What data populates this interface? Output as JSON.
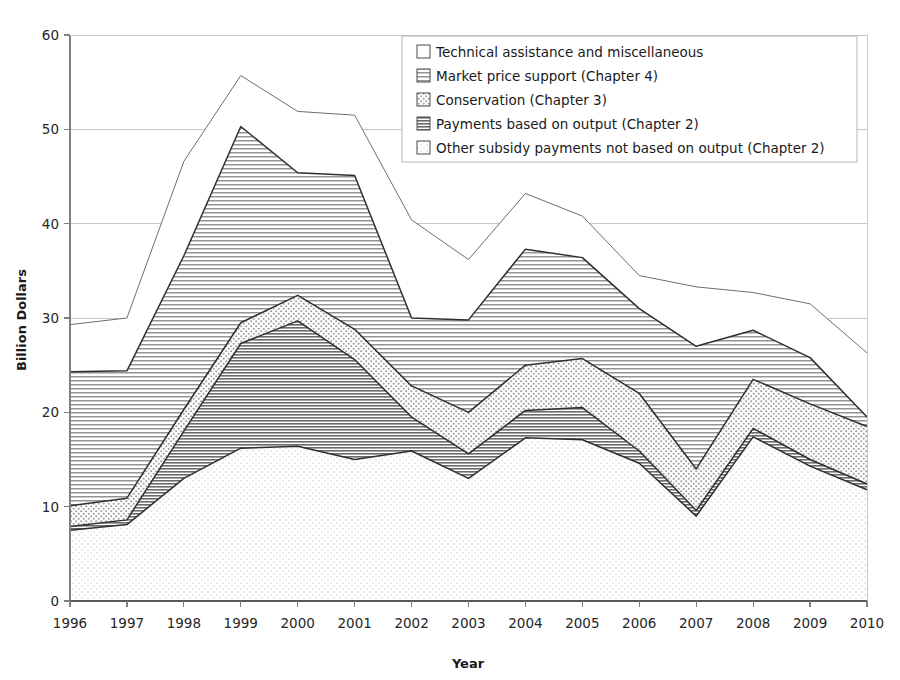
{
  "chart_data": {
    "type": "area",
    "title": "",
    "subtitle": "",
    "xlabel": "Year",
    "ylabel": "Billion Dollars",
    "stacked": true,
    "grid": true,
    "legend_position": "top-right",
    "xlim": [
      1996,
      2010
    ],
    "ylim": [
      0,
      60
    ],
    "yticks": [
      0,
      10,
      20,
      30,
      40,
      50,
      60
    ],
    "categories": [
      "1996",
      "1997",
      "1998",
      "1999",
      "2000",
      "2001",
      "2002",
      "2003",
      "2004",
      "2005",
      "2006",
      "2007",
      "2008",
      "2009",
      "2010"
    ],
    "x": [
      1996,
      1997,
      1998,
      1999,
      2000,
      2001,
      2002,
      2003,
      2004,
      2005,
      2006,
      2007,
      2008,
      2009,
      2010
    ],
    "series": [
      {
        "name": "Other subsidy payments not based on output (Chapter 2)",
        "pattern": "fine-dots",
        "values": [
          7.5,
          8.1,
          13.0,
          16.2,
          16.4,
          15.0,
          15.9,
          13.0,
          17.3,
          17.1,
          14.6,
          9.0,
          17.4,
          14.3,
          11.8
        ]
      },
      {
        "name": "Payments based on output (Chapter 2)",
        "pattern": "horizontal-lines-dark",
        "values": [
          0.4,
          0.5,
          5.0,
          11.1,
          13.3,
          10.6,
          3.6,
          2.6,
          2.9,
          3.4,
          1.3,
          0.6,
          0.9,
          0.7,
          0.6
        ]
      },
      {
        "name": "Conservation (Chapter 3)",
        "pattern": "cross-dots",
        "values": [
          2.2,
          2.3,
          2.3,
          2.2,
          2.7,
          3.2,
          3.3,
          4.4,
          4.8,
          5.2,
          6.1,
          4.4,
          5.2,
          5.9,
          6.1
        ]
      },
      {
        "name": "Market price support (Chapter 4)",
        "pattern": "horizontal-lines",
        "values": [
          14.2,
          13.5,
          16.3,
          20.8,
          13.0,
          16.3,
          7.2,
          9.8,
          12.3,
          10.7,
          9.0,
          13.0,
          5.2,
          4.9,
          1.0
        ]
      },
      {
        "name": "Technical assistance and miscellaneous",
        "pattern": "plain",
        "values": [
          5.0,
          5.6,
          10.0,
          5.4,
          6.5,
          6.4,
          10.4,
          6.4,
          5.9,
          4.4,
          3.5,
          6.3,
          4.0,
          5.7,
          6.8
        ]
      }
    ],
    "totals": [
      29.3,
      30.0,
      46.6,
      55.7,
      51.9,
      51.5,
      40.4,
      36.2,
      43.2,
      40.8,
      34.5,
      33.3,
      32.7,
      31.5,
      26.3
    ]
  },
  "legend": {
    "items": [
      {
        "label": "Technical assistance and miscellaneous",
        "pattern": "plain"
      },
      {
        "label": "Market price support (Chapter 4)",
        "pattern": "horizontal-lines"
      },
      {
        "label": "Conservation (Chapter 3)",
        "pattern": "cross-dots"
      },
      {
        "label": "Payments based on output (Chapter 2)",
        "pattern": "horizontal-lines-dark"
      },
      {
        "label": "Other subsidy payments not based on output (Chapter 2)",
        "pattern": "fine-dots"
      }
    ]
  },
  "axes": {
    "y_title": "Billion Dollars",
    "x_title": "Year",
    "y_ticks": [
      "0",
      "10",
      "20",
      "30",
      "40",
      "50",
      "60"
    ],
    "x_ticks": [
      "1996",
      "1997",
      "1998",
      "1999",
      "2000",
      "2001",
      "2002",
      "2003",
      "2004",
      "2005",
      "2006",
      "2007",
      "2008",
      "2009",
      "2010"
    ]
  },
  "colors": {
    "axis": "#808080",
    "grid": "#c8c8c8",
    "line": "#333333",
    "text": "#1a1a1a"
  }
}
